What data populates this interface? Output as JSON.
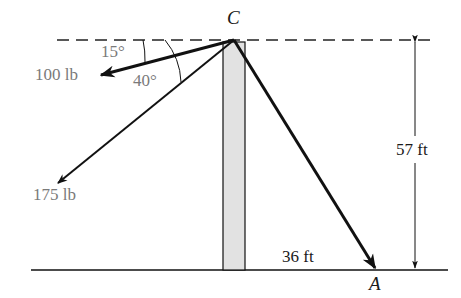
{
  "diagram": {
    "points": {
      "C": "C",
      "A": "A"
    },
    "forces": [
      {
        "label": "100 lb",
        "angle_label": "15°"
      },
      {
        "label": "175 lb",
        "angle_label": "40°"
      }
    ],
    "dimensions": {
      "height": "57 ft",
      "horizontal": "36 ft"
    },
    "colors": {
      "line": "#111111",
      "pole_fill": "#e2e2e2",
      "force_label": "#7a7a7a"
    }
  }
}
